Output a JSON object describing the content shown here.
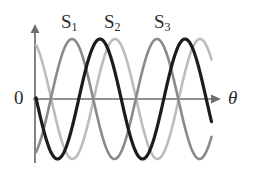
{
  "figure": {
    "name": "three-phase-sine-wave-diagram",
    "width": 265,
    "height": 180,
    "background_color": "#ffffff"
  },
  "axes": {
    "origin_label": "0",
    "x_axis_label": "θ",
    "y_axis_label": "",
    "x_axis": {
      "x_start": 33,
      "x_end": 215,
      "y": 99,
      "color": "#6e6e6e",
      "arrow": true
    },
    "y_axis": {
      "x": 35,
      "y_top": 27,
      "y_bottom": 163,
      "color": "#6e6e6e",
      "arrow": true
    },
    "tick_labels_x": [],
    "tick_labels_y": [],
    "grid": false
  },
  "chart_data": {
    "type": "line",
    "title": "",
    "subtitle": "",
    "xlabel": "θ",
    "ylabel": "",
    "xlim": [
      -20,
      220
    ],
    "ylim": [
      -1.15,
      1.15
    ],
    "grid": false,
    "legend_position": "above-curves-inline",
    "annotations": [
      "0",
      "θ"
    ],
    "amplitude": 1.0,
    "period_px": 85,
    "series": [
      {
        "name": "S₁",
        "label": "S1",
        "label_base": "S",
        "label_sub": "1",
        "color": "#8a8a8a",
        "stroke_width": 2.6,
        "phase_deg": 0,
        "peak_x_px": 72,
        "trough_x_px": 114,
        "label_x_px": 61,
        "label_y_px": 12
      },
      {
        "name": "S₂",
        "label": "S2",
        "label_base": "S",
        "label_sub": "2",
        "color": "#bcbcbc",
        "stroke_width": 2.6,
        "phase_deg": -120,
        "peak_x_px": 115,
        "trough_x_px": 72,
        "label_x_px": 104,
        "label_y_px": 12
      },
      {
        "name": "S₃",
        "label": "S3",
        "label_base": "S",
        "label_sub": "3",
        "color": "#1c1c1c",
        "stroke_width": 3.2,
        "phase_deg": 120,
        "peak_x_px": 185,
        "trough_x_px": 143,
        "label_x_px": 154,
        "label_y_px": 12
      }
    ]
  }
}
